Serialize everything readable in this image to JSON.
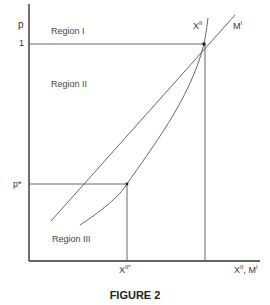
{
  "figure": {
    "caption": "FIGURE 2",
    "y_axis_label": "p",
    "x_axis_label": {
      "base1": "X",
      "sup1": "II",
      "sep": ", ",
      "base2": "M",
      "sup2": "I"
    },
    "y_ticks": [
      {
        "label": "1",
        "y_px": 44
      },
      {
        "label": "p*",
        "y_px": 184
      }
    ],
    "x_ticks": [
      {
        "base": "X",
        "sup": "II*",
        "x_px": 127
      }
    ],
    "regions": [
      {
        "label": "Region I"
      },
      {
        "label": "Region II"
      },
      {
        "label": "Region III"
      }
    ],
    "curves": [
      {
        "name": "M^I",
        "label_base": "M",
        "label_sup": "I",
        "kind": "straight line"
      },
      {
        "name": "X^II",
        "label_base": "X",
        "label_sup": "II",
        "kind": "convex curve"
      }
    ],
    "colors": {
      "axis": "#333333",
      "lines": "#555555",
      "text": "#333333"
    }
  }
}
